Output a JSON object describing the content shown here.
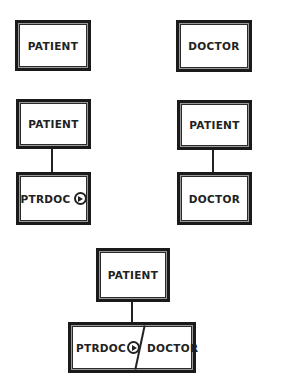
{
  "diagram": {
    "row1": {
      "left": {
        "label": "PATIENT"
      },
      "right": {
        "label": "DOCTOR"
      }
    },
    "row2": {
      "left": {
        "parent": "PATIENT",
        "child": "PTRDOC",
        "child_icon": "play-circle-icon"
      },
      "right": {
        "parent": "PATIENT",
        "child": "DOCTOR"
      }
    },
    "row3": {
      "parent": "PATIENT",
      "child_left": "PTRDOC",
      "child_icon": "play-circle-icon",
      "child_right": "DOCTOR"
    }
  }
}
